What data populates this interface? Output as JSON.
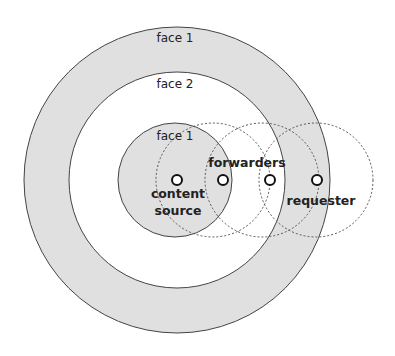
{
  "diagram": {
    "colors": {
      "ring_fill": "#e0e0e0",
      "inner_fill": "#ffffff",
      "stroke": "#444444",
      "dashed_stroke": "#555555",
      "node_fill": "#ffffff",
      "text": "#222222"
    },
    "rings": [
      {
        "id": "outer-face-1",
        "label": "face 1"
      },
      {
        "id": "middle-face-2",
        "label": "face 2"
      },
      {
        "id": "inner-face-1",
        "label": "face 1"
      }
    ],
    "nodes": [
      {
        "id": "content-source",
        "role": "content source"
      },
      {
        "id": "forwarder-1",
        "role": "forwarder"
      },
      {
        "id": "forwarder-2",
        "role": "forwarder"
      },
      {
        "id": "requester",
        "role": "requester"
      }
    ],
    "labels": {
      "content_line1": "content",
      "content_line2": "source",
      "forwarders": "forwarders",
      "requester": "requester"
    }
  }
}
